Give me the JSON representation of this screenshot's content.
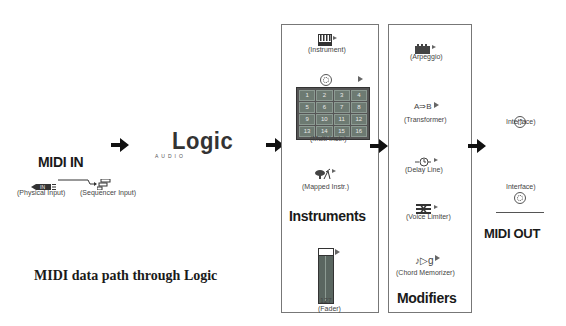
{
  "caption": "MIDI data path through Logic",
  "midi_in": {
    "title": "MIDI IN",
    "physical_input_label": "(Physical Input)",
    "sequencer_input_label": "(Sequencer Input)",
    "physical_input_badge": "IN"
  },
  "logic_logo": {
    "wordmark": "Logic",
    "subtitle": "AUDIO"
  },
  "instruments": {
    "title": "Instruments",
    "instrument_label": "(Instrument)",
    "multi_instr_label": "(Multi Instr.)",
    "multi_channels": [
      "1",
      "2",
      "3",
      "4",
      "5",
      "6",
      "7",
      "8",
      "9",
      "10",
      "11",
      "12",
      "13",
      "14",
      "15",
      "16"
    ],
    "mapped_instr_label": "(Mapped Instr.)",
    "fader_value": "127",
    "fader_label": "(Fader)"
  },
  "modifiers": {
    "title": "Modifiers",
    "arpeggio_label": "(Arpeggio)",
    "transformer_glyph": "A⇒B",
    "transformer_label": "(Transformer)",
    "delay_line_label": "(Delay Line)",
    "voice_limiter_label": "(Voice Limiter)",
    "chord_memorizer_glyph": "♪▷ɡ",
    "chord_memorizer_label": "(Chord Memorizer)"
  },
  "midi_out": {
    "title": "MIDI OUT",
    "interface_1_label": "Interface)",
    "interface_2_label": "Interface)"
  },
  "colors": {
    "background": "#ffffff",
    "text": "#1a1a1a",
    "box_border": "#777777",
    "grid_cell": "#6d7a72",
    "fader_body": "#5a6660"
  }
}
